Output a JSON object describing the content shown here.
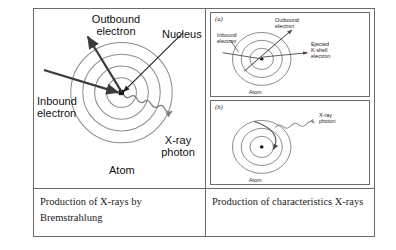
{
  "figure": {
    "left_panel": {
      "labels": {
        "outbound_electron": "Outbound\nelectron",
        "nucleus": "Nucleus",
        "inbound_electron": "Inbound\nelectron",
        "xray_photon": "X-ray\nphoton",
        "atom": "Atom"
      },
      "shells": 4,
      "nucleus_shape": "square"
    },
    "right_panel": {
      "subpanel_a": {
        "letter": "(a)",
        "labels": {
          "inbound_electron": "Inbound\nelectron",
          "outbound_electron": "Outbound\nelectron",
          "ejected_k_shell_electron": "Ejected\nK-shell\nelectron",
          "atom": "Atom"
        },
        "shells": 3,
        "nucleus_shape": "dot"
      },
      "subpanel_b": {
        "letter": "(b)",
        "labels": {
          "xray_photon": "X-ray\nphoton",
          "atom": "Atom"
        },
        "shells": 3,
        "nucleus_shape": "dot"
      }
    },
    "captions": {
      "left": "Production of X-rays by\nBremstrahlung",
      "right": "Production of\ncharacteristics X-rays"
    }
  },
  "colors": {
    "border": "#6b6b6b",
    "shell_stroke": "#8a8a8a",
    "arrow_dark": "#3b3b3b",
    "text": "#111111",
    "background": "#ffffff"
  }
}
